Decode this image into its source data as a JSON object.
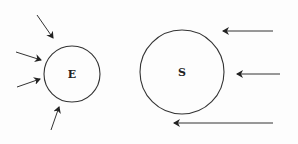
{
  "diagram": {
    "stroke_color": "#333333",
    "bodies": [
      {
        "id": "E",
        "label": "E",
        "cx": 72,
        "cy": 74,
        "r": 28
      },
      {
        "id": "S",
        "label": "S",
        "cx": 182,
        "cy": 72,
        "r": 42
      }
    ],
    "arrows_E": [
      {
        "x1": 37,
        "y1": 15,
        "x2": 53,
        "y2": 38
      },
      {
        "x1": 16,
        "y1": 52,
        "x2": 41,
        "y2": 60
      },
      {
        "x1": 17,
        "y1": 87,
        "x2": 40,
        "y2": 79
      },
      {
        "x1": 51,
        "y1": 130,
        "x2": 59,
        "y2": 107
      }
    ],
    "arrows_S": [
      {
        "x1": 273,
        "y1": 31,
        "x2": 223,
        "y2": 31
      },
      {
        "x1": 280,
        "y1": 74,
        "x2": 237,
        "y2": 74
      },
      {
        "x1": 273,
        "y1": 123,
        "x2": 174,
        "y2": 123
      }
    ]
  }
}
